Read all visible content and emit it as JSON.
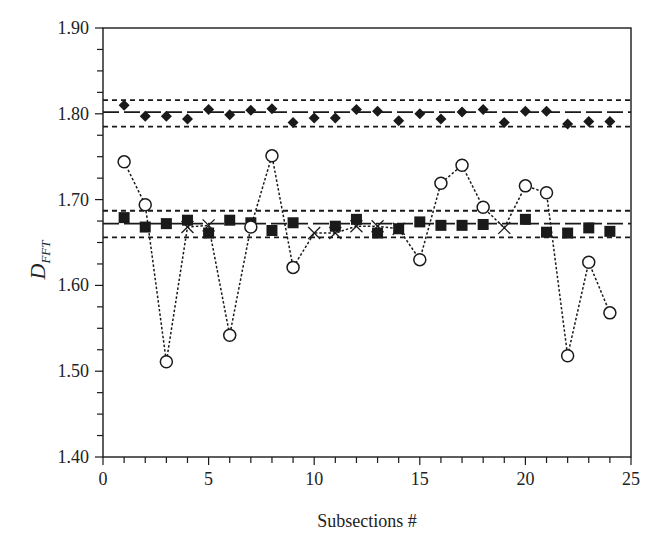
{
  "chart_data": {
    "type": "scatter",
    "title": "",
    "xlabel": "Subsections #",
    "ylabel": "D",
    "ylabel_subscript": "FFT",
    "xlim": [
      0,
      25
    ],
    "ylim": [
      1.4,
      1.9
    ],
    "xticks_major": [
      0,
      5,
      10,
      15,
      20,
      25
    ],
    "xtick_labels": [
      "0",
      "5",
      "10",
      "15",
      "20",
      "25"
    ],
    "xticks_minor_step": 1,
    "yticks_major": [
      1.4,
      1.5,
      1.6,
      1.7,
      1.8,
      1.9
    ],
    "ytick_labels": [
      "1.40",
      "1.50",
      "1.60",
      "1.70",
      "1.80",
      "1.90"
    ],
    "yticks_minor_step": 0.025,
    "grid": false,
    "legend": null,
    "x": [
      1,
      2,
      3,
      4,
      5,
      6,
      7,
      8,
      9,
      10,
      11,
      12,
      13,
      14,
      15,
      16,
      17,
      18,
      19,
      20,
      21,
      22,
      23,
      24
    ],
    "series": [
      {
        "name": "diamonds",
        "marker": "diamond-filled",
        "line": "none",
        "values": [
          1.81,
          1.797,
          1.797,
          1.794,
          1.805,
          1.799,
          1.804,
          1.806,
          1.79,
          1.795,
          1.795,
          1.805,
          1.803,
          1.792,
          1.8,
          1.794,
          1.802,
          1.805,
          1.79,
          1.803,
          1.803,
          1.788,
          1.791,
          1.791
        ]
      },
      {
        "name": "squares",
        "marker": "square-filled",
        "line": "none",
        "values": [
          1.679,
          1.668,
          1.672,
          1.676,
          1.661,
          1.676,
          1.673,
          1.664,
          1.673,
          null,
          1.669,
          1.677,
          1.661,
          1.666,
          1.674,
          1.67,
          1.67,
          1.671,
          null,
          1.677,
          1.662,
          1.661,
          1.667,
          1.663
        ]
      },
      {
        "name": "circles",
        "marker": "circle-open",
        "line": "dotted",
        "note": "points lying within the mean band are drawn as crosses",
        "values": [
          1.744,
          1.694,
          1.511,
          1.668,
          1.67,
          1.542,
          1.668,
          1.751,
          1.621,
          1.661,
          1.661,
          1.669,
          1.669,
          1.666,
          1.63,
          1.719,
          1.74,
          1.691,
          1.667,
          1.716,
          1.708,
          1.518,
          1.627,
          1.568
        ],
        "cross_at_x": [
          4,
          5,
          10,
          11,
          12,
          13,
          14,
          19
        ]
      }
    ],
    "reference_lines": [
      {
        "name": "diamond-upper",
        "y": 1.816,
        "style": "dotted"
      },
      {
        "name": "diamond-mean",
        "y": 1.802,
        "style": "dashed"
      },
      {
        "name": "diamond-lower",
        "y": 1.785,
        "style": "dotted"
      },
      {
        "name": "square-upper",
        "y": 1.687,
        "style": "dotted"
      },
      {
        "name": "square-mean",
        "y": 1.672,
        "style": "dashed"
      },
      {
        "name": "square-lower",
        "y": 1.656,
        "style": "dotted"
      }
    ],
    "colors": {
      "ink": "#1a1a1a",
      "background": "#ffffff"
    }
  }
}
